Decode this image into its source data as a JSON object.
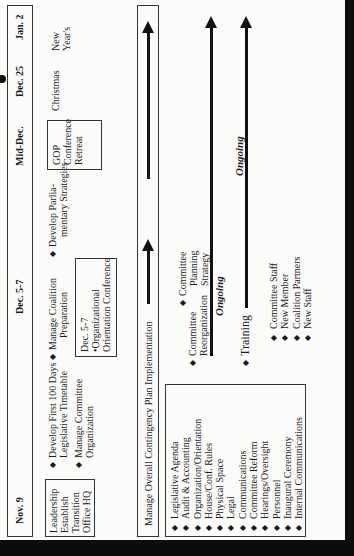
{
  "timeline": {
    "dates": [
      "Nov. 9",
      "Dec. 5-7",
      "Mid-Dec.",
      "Dec. 25",
      "Jan. 2"
    ]
  },
  "row1": {
    "leadership_box": [
      "Leadership",
      "Establish",
      "Transition",
      "Office HQ"
    ],
    "develop_first_100": [
      "Develop First 100 Days",
      "Legislative Timetable"
    ],
    "manage_committee": [
      "Manage Committee",
      "Organization"
    ],
    "manage_coalition": [
      "Manage Coalition",
      "Preparation"
    ],
    "develop_parliamentary": [
      "Develop Parlia-",
      "mentary Strategies"
    ],
    "dec57_box": [
      "Dec. 5-7",
      "•Organizational",
      "Orientation Conference"
    ],
    "gop_box": [
      "GOP",
      "Conference",
      "Retreat"
    ],
    "christmas": "Christmas",
    "new_years": [
      "New",
      "Year's"
    ]
  },
  "contingency": {
    "label": "Manage Overall Contingency Plan Implementation"
  },
  "list_box": {
    "items": [
      "Legislative Agenda",
      "Audit & Accounting",
      "Organization/Orientation",
      "House/Conf. Rules",
      "Physical Space",
      "Legal",
      "Communications",
      "Committee Reform",
      "Hearings/Oversight",
      "Personnel",
      "Inaugural Ceremony",
      "Internal Communications"
    ]
  },
  "committee": {
    "reorganization": [
      "Committee",
      "Reorganization"
    ],
    "planning": [
      "Committee",
      "Planning",
      "Strategy"
    ],
    "ongoing_1": "Ongoing"
  },
  "training": {
    "label": "Training",
    "ongoing_2": "Ongoing",
    "items": [
      "Committee Staff",
      "New Member",
      "Coalition Partners",
      "New Staff"
    ]
  }
}
